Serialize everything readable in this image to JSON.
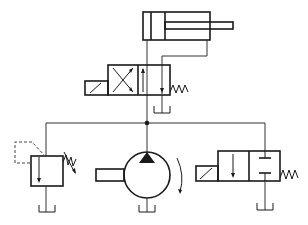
{
  "diagram": {
    "title": "Hydraulic circuit schematic",
    "type": "hydraulic-circuit",
    "line_color": "#1a1a1a",
    "background": "#ffffff",
    "components": [
      {
        "id": "cylinder",
        "label": "Double-acting cylinder",
        "icon": "cylinder-icon"
      },
      {
        "id": "dir-valve-4-2",
        "label": "4/2 solenoid directional valve with spring return",
        "icon": "valve-icon"
      },
      {
        "id": "tank-valve",
        "label": "Tank",
        "icon": "tank-icon"
      },
      {
        "id": "relief-valve",
        "label": "Pressure relief valve (adjustable)",
        "icon": "relief-valve-icon"
      },
      {
        "id": "tank-relief",
        "label": "Tank",
        "icon": "tank-icon"
      },
      {
        "id": "pump",
        "label": "Hydraulic pump (fixed displacement)",
        "icon": "pump-icon"
      },
      {
        "id": "tank-pump",
        "label": "Tank",
        "icon": "tank-icon"
      },
      {
        "id": "unload-valve-2-2",
        "label": "2/2 solenoid valve with spring return",
        "icon": "valve-icon"
      },
      {
        "id": "tank-unload",
        "label": "Tank",
        "icon": "tank-icon"
      }
    ],
    "connections": [
      {
        "from": "pump",
        "to": "junction"
      },
      {
        "from": "junction",
        "to": "relief-valve"
      },
      {
        "from": "junction",
        "to": "unload-valve-2-2"
      },
      {
        "from": "junction",
        "to": "dir-valve-4-2"
      },
      {
        "from": "dir-valve-4-2",
        "to": "cylinder"
      }
    ]
  }
}
